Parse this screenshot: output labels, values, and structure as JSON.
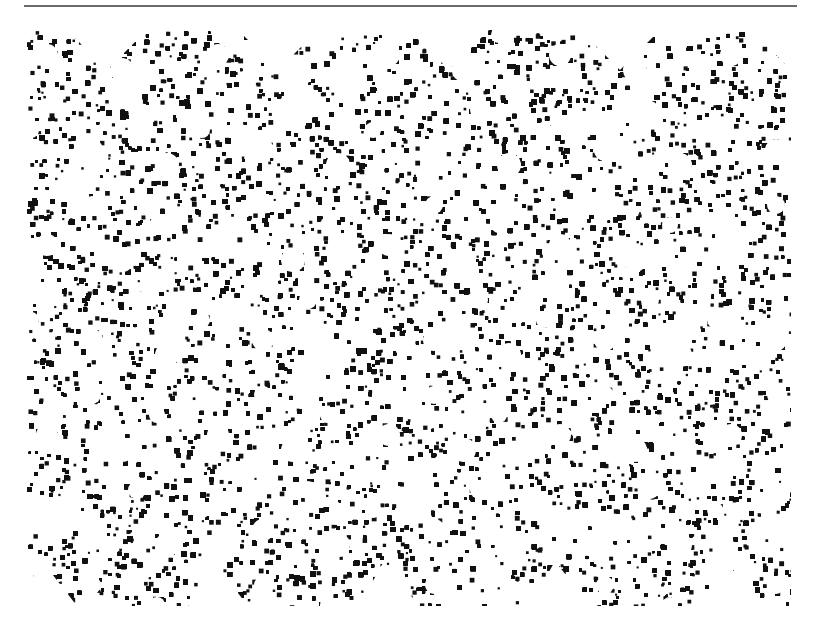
{
  "figure": {
    "colors": {
      "foreground": "#111111",
      "background": "#ffffff",
      "rule": "#6b6b6b"
    },
    "tiles_horizontal": 4.5,
    "tile_period_px": 171
  }
}
